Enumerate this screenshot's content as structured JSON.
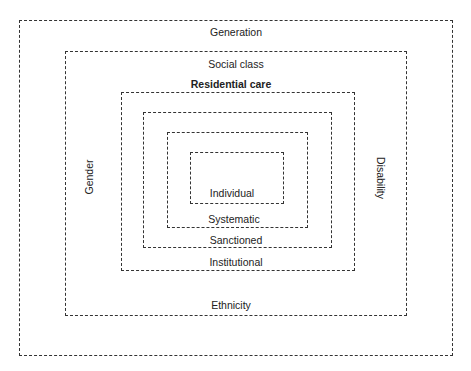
{
  "header": {
    "cropped_caption": "(Diagram continued)"
  },
  "diagram": {
    "layers": [
      {
        "id": "generation",
        "label": "Generation"
      },
      {
        "id": "social-class",
        "label": "Social class",
        "bottom_label": "Ethnicity",
        "left_label": "Gender",
        "right_label": "Disability"
      },
      {
        "id": "residential-care",
        "label": "Residential care",
        "bottom_label": "Institutional"
      },
      {
        "id": "sanctioned",
        "bottom_label": "Sanctioned"
      },
      {
        "id": "systematic",
        "bottom_label": "Systematic"
      },
      {
        "id": "individual",
        "label": "Individual"
      }
    ]
  }
}
